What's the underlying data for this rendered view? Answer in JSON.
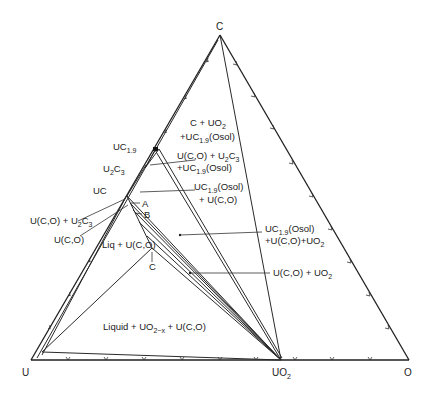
{
  "diagram": {
    "type": "ternary phase diagram",
    "vertices": {
      "top": "C",
      "bottom_left": "U",
      "bottom_right": "O",
      "bottom_mid": "UO",
      "bottom_mid_sub": "2"
    },
    "phase_points": {
      "uc19": {
        "main": "UC",
        "sub": "1.9"
      },
      "u2c3": {
        "main": "U",
        "sub1": "2",
        "main2": "C",
        "sub2": "3"
      },
      "uc": "UC",
      "a": "A",
      "b": "B",
      "c": "C"
    },
    "region_labels": {
      "c_uo2_uc19_line1": "C + UO",
      "c_uo2_uc19_line1_sub": "2",
      "c_uo2_uc19_line2a": "+UC",
      "c_uo2_uc19_line2_sub": "1.9",
      "c_uo2_uc19_line2b": "(Osol)",
      "uco_u2c3_line1a": "U(C,O) + U",
      "uco_u2c3_line1_sub1": "2",
      "uco_u2c3_line1b": "C",
      "uco_u2c3_line1_sub2": "3",
      "uco_u2c3_line2a": "+UC",
      "uco_u2c3_line2_sub": "1.9",
      "uco_u2c3_line2b": "(Osol)",
      "uc19_uco_line1a": "UC",
      "uc19_uco_line1_sub": "1.9",
      "uc19_uco_line1b": "(Osol)",
      "uc19_uco_line2": "+ U(C,O)",
      "uc19_uco_uo2_line1a": "UC",
      "uc19_uco_uo2_line1_sub": "1.9",
      "uc19_uco_uo2_line1b": "(Osol)",
      "uc19_uco_uo2_line2a": "+U(C,O)+UO",
      "uc19_uco_uo2_line2_sub": "2",
      "uco_uo2_a": "U(C,O) + UO",
      "uco_uo2_sub": "2",
      "uco_u2c3_left_a": "U(C,O) + U",
      "uco_u2c3_left_sub1": "2",
      "uco_u2c3_left_b": "C",
      "uco_u2c3_left_sub2": "3",
      "uco_left": "U(C,O)",
      "liq_uco": "Liq + U(C,O)",
      "liquid_a": "Liquid + UO",
      "liquid_sub": "2−x",
      "liquid_b": " + U(C,O)"
    }
  }
}
